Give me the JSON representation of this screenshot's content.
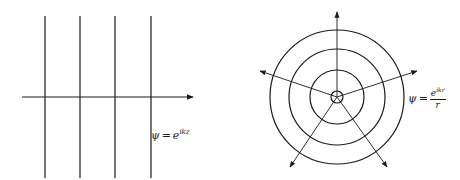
{
  "left_panel": {
    "title": "plane wave",
    "wavefront_x": [
      45,
      80,
      115,
      151
    ],
    "wavefront_y_range": [
      16,
      178
    ],
    "axis": {
      "y": 97,
      "x_start": 22,
      "x_end": 193
    },
    "label": {
      "psi": "ψ",
      "eq": "=",
      "base": "e",
      "exponent": "ikz"
    }
  },
  "right_panel": {
    "title": "spherical wave",
    "center": [
      337,
      97
    ],
    "radii": [
      6,
      27,
      48,
      67
    ],
    "ray_angles_deg": [
      90,
      165,
      15,
      240,
      300
    ],
    "label": {
      "psi": "ψ",
      "eq": "=",
      "num_base": "e",
      "num_exponent": "ikr",
      "den": "r"
    }
  },
  "colors": {
    "stroke": "#1a1a1a",
    "background": "#ffffff"
  }
}
